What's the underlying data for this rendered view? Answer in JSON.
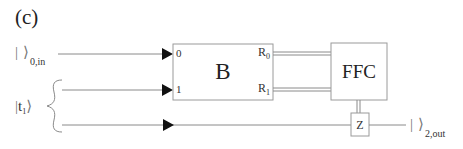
{
  "panel_label": "(c)",
  "inputs": {
    "top": {
      "ket_open": "|",
      "ket_close": "⟩",
      "subscript": "0,in"
    },
    "pair": {
      "ket_open": "|",
      "symbol": "t",
      "symbol_sub": "1",
      "ket_close": "⟩"
    }
  },
  "output": {
    "ket_open": "|",
    "ket_close": "⟩",
    "subscript": "2,out"
  },
  "blocks": {
    "B": {
      "title": "B",
      "ports_in": [
        "0",
        "1"
      ],
      "ports_out": [
        {
          "base": "R",
          "sub": "0"
        },
        {
          "base": "R",
          "sub": "1"
        }
      ]
    },
    "FFC": {
      "title": "FFC"
    },
    "Z": {
      "title": "Z"
    }
  },
  "colors": {
    "line": "#8a8a8a",
    "box_border": "#9a9a9a",
    "arrow": "#111111",
    "text": "#222222"
  }
}
